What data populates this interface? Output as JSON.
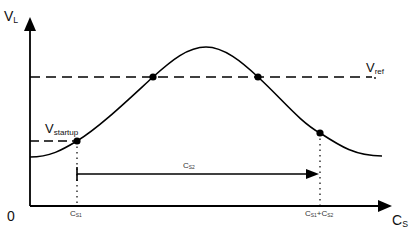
{
  "diagram": {
    "type": "voltage-vs-capacitance curve",
    "axes": {
      "y_label_main": "V",
      "y_label_sub": "L",
      "x_label_main": "C",
      "x_label_sub": "S",
      "origin_label": "0"
    },
    "reference_lines": {
      "vref_main": "V",
      "vref_sub": "ref",
      "vstartup_main": "V",
      "vstartup_sub": "startup"
    },
    "markers": {
      "cs1_main": "C",
      "cs1_sub": "S1",
      "cs1cs2_a_main": "C",
      "cs1cs2_a_sub": "S1",
      "cs1cs2_plus": "+",
      "cs1cs2_b_main": "C",
      "cs1cs2_b_sub": "S2",
      "span_main": "C",
      "span_sub": "S2"
    },
    "points": [
      {
        "name": "startup-point",
        "x": 77,
        "y": 141
      },
      {
        "name": "vref-left-crossing",
        "x": 153,
        "y": 77
      },
      {
        "name": "vref-right-crossing",
        "x": 258,
        "y": 77
      },
      {
        "name": "cs1-cs2-point",
        "x": 320,
        "y": 133
      }
    ],
    "colors": {
      "line": "#000000",
      "background": "#ffffff"
    }
  }
}
